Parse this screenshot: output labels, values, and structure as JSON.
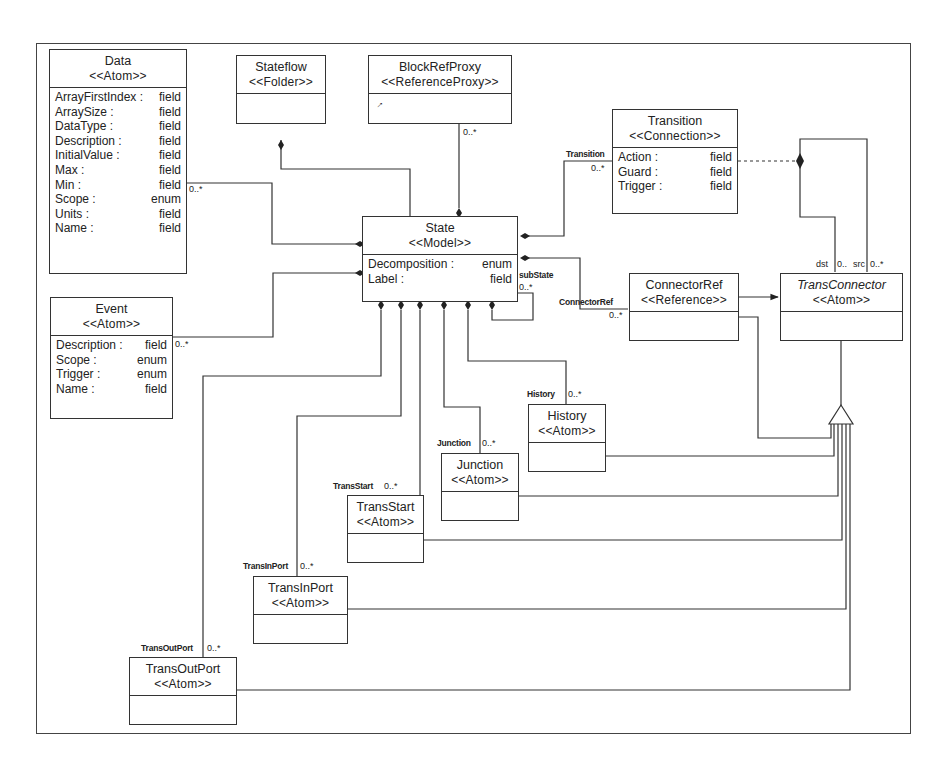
{
  "diagram": {
    "type": "UML class diagram (metamodel)",
    "colors": {
      "line": "#333333",
      "background": "#ffffff",
      "frame": "#444444"
    }
  },
  "classes": {
    "data": {
      "name": "Data",
      "stereotype": "<<Atom>>",
      "attributes": [
        {
          "name": "ArrayFirstIndex :",
          "type": "field"
        },
        {
          "name": "ArraySize :",
          "type": "field"
        },
        {
          "name": "DataType :",
          "type": "field"
        },
        {
          "name": "Description :",
          "type": "field"
        },
        {
          "name": "InitialValue :",
          "type": "field"
        },
        {
          "name": "Max :",
          "type": "field"
        },
        {
          "name": "Min :",
          "type": "field"
        },
        {
          "name": "Scope :",
          "type": "enum"
        },
        {
          "name": "Units :",
          "type": "field"
        },
        {
          "name": "Name :",
          "type": "field"
        }
      ]
    },
    "stateflow": {
      "name": "Stateflow",
      "stereotype": "<<Folder>>",
      "attributes": []
    },
    "blockrefproxy": {
      "name": "BlockRefProxy",
      "stereotype": "<<ReferenceProxy>>",
      "icon": "shortcut-arrow-icon",
      "attributes": []
    },
    "transition": {
      "name": "Transition",
      "stereotype": "<<Connection>>",
      "attributes": [
        {
          "name": "Action :",
          "type": "field"
        },
        {
          "name": "Guard :",
          "type": "field"
        },
        {
          "name": "Trigger :",
          "type": "field"
        }
      ]
    },
    "state": {
      "name": "State",
      "stereotype": "<<Model>>",
      "attributes": [
        {
          "name": "Decomposition :",
          "type": "enum"
        },
        {
          "name": "Label :",
          "type": "field"
        }
      ]
    },
    "event": {
      "name": "Event",
      "stereotype": "<<Atom>>",
      "attributes": [
        {
          "name": "Description :",
          "type": "field"
        },
        {
          "name": "Scope :",
          "type": "enum"
        },
        {
          "name": "Trigger :",
          "type": "enum"
        },
        {
          "name": "Name :",
          "type": "field"
        }
      ]
    },
    "connectorref": {
      "name": "ConnectorRef",
      "stereotype": "<<Reference>>",
      "attributes": []
    },
    "transconnector": {
      "name": "TransConnector",
      "stereotype": "<<Atom>>",
      "abstract": true,
      "attributes": []
    },
    "history": {
      "name": "History",
      "stereotype": "<<Atom>>",
      "attributes": []
    },
    "junction": {
      "name": "Junction",
      "stereotype": "<<Atom>>",
      "attributes": []
    },
    "transstart": {
      "name": "TransStart",
      "stereotype": "<<Atom>>",
      "attributes": []
    },
    "transinport": {
      "name": "TransInPort",
      "stereotype": "<<Atom>>",
      "attributes": []
    },
    "transoutport": {
      "name": "TransOutPort",
      "stereotype": "<<Atom>>",
      "attributes": []
    }
  },
  "labels": {
    "data_mult": "0..*",
    "event_mult": "0..*",
    "blockref_mult": "0..*",
    "transition_role": "Transition",
    "transition_mult": "0..*",
    "substate_role": "subState",
    "substate_mult": "0..*",
    "connectorref_role": "ConnectorRef",
    "connectorref_mult": "0..*",
    "dst_role": "dst",
    "dst_mult": "0..",
    "src_role": "src",
    "src_mult": "0..*",
    "history_role": "History",
    "history_mult": "0..*",
    "junction_role": "Junction",
    "junction_mult": "0..*",
    "transstart_role": "TransStart",
    "transstart_mult": "0..*",
    "transinport_role": "TransInPort",
    "transinport_mult": "0..*",
    "transoutport_role": "TransOutPort",
    "transoutport_mult": "0..*"
  },
  "relationships": [
    {
      "from": "Data",
      "to": "State",
      "kind": "containment",
      "multiplicity": "0..*"
    },
    {
      "from": "Event",
      "to": "State",
      "kind": "containment",
      "multiplicity": "0..*"
    },
    {
      "from": "State",
      "to": "Stateflow",
      "kind": "containment"
    },
    {
      "from": "BlockRefProxy",
      "to": "State",
      "kind": "containment",
      "multiplicity": "0..*"
    },
    {
      "from": "Transition",
      "to": "State",
      "kind": "containment",
      "role": "Transition",
      "multiplicity": "0..*"
    },
    {
      "from": "State",
      "to": "State",
      "kind": "containment",
      "role": "subState",
      "multiplicity": "0..*"
    },
    {
      "from": "ConnectorRef",
      "to": "State",
      "kind": "containment",
      "role": "ConnectorRef",
      "multiplicity": "0..*"
    },
    {
      "from": "ConnectorRef",
      "to": "TransConnector",
      "kind": "reference"
    },
    {
      "from": "Transition",
      "to": "TransConnector",
      "kind": "connection",
      "roles": [
        "dst",
        "src"
      ]
    },
    {
      "from": "History",
      "to": "State",
      "kind": "containment",
      "role": "History",
      "multiplicity": "0..*"
    },
    {
      "from": "Junction",
      "to": "State",
      "kind": "containment",
      "role": "Junction",
      "multiplicity": "0..*"
    },
    {
      "from": "TransStart",
      "to": "State",
      "kind": "containment",
      "role": "TransStart",
      "multiplicity": "0..*"
    },
    {
      "from": "TransInPort",
      "to": "State",
      "kind": "containment",
      "role": "TransInPort",
      "multiplicity": "0..*"
    },
    {
      "from": "TransOutPort",
      "to": "State",
      "kind": "containment",
      "role": "TransOutPort",
      "multiplicity": "0..*"
    },
    {
      "from": [
        "State",
        "ConnectorRef",
        "History",
        "Junction",
        "TransStart",
        "TransInPort",
        "TransOutPort"
      ],
      "to": "TransConnector",
      "kind": "inheritance"
    }
  ]
}
